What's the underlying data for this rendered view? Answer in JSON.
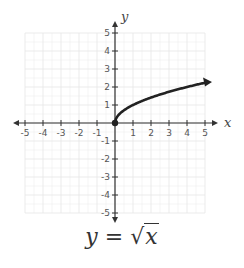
{
  "chart_data": {
    "type": "line",
    "title": "",
    "function": "y = sqrt(x)",
    "xlabel": "x",
    "ylabel": "y",
    "xlim": [
      -5,
      5
    ],
    "ylim": [
      -5,
      5
    ],
    "grid": true,
    "x_ticks": [
      -5,
      -4,
      -3,
      -2,
      -1,
      1,
      2,
      3,
      4,
      5
    ],
    "y_ticks": [
      5,
      4,
      3,
      2,
      1,
      -1,
      -2,
      -3,
      -4,
      -5
    ],
    "series": [
      {
        "name": "y = √x",
        "start_point": [
          0,
          0
        ],
        "end_arrow": true,
        "x": [
          0,
          0.25,
          0.5,
          1,
          1.5,
          2,
          2.5,
          3,
          3.5,
          4,
          4.5,
          5
        ],
        "y": [
          0,
          0.5,
          0.707,
          1,
          1.225,
          1.414,
          1.581,
          1.732,
          1.871,
          2,
          2.121,
          2.236
        ]
      }
    ],
    "colors": {
      "curve": "#222222",
      "axis": "#333333",
      "grid": "#e6e6e6"
    }
  },
  "caption": {
    "lhs": "y",
    "eq": " = ",
    "radical": "√",
    "radicand": "x"
  }
}
